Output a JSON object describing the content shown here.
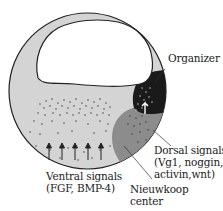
{
  "diagram": {
    "type": "embryo-signaling-diagram",
    "colors": {
      "embryo_fill": "#d4d4d4",
      "outline": "#222222",
      "blastocoel_fill": "#ffffff",
      "organizer_fill": "#1a1a1a",
      "nieuwkoop_fill": "#8c8c8c",
      "dots": "#333333"
    },
    "labels": {
      "organizer": "Organizer",
      "dorsal_title": "Dorsal signals",
      "dorsal_line2": "(Vg1, noggin,",
      "dorsal_line3": "activin,wnt)",
      "ventral_title": "Ventral signals",
      "ventral_line2": "(FGF, BMP-4)",
      "nieuwkoop_line1": "Nieuwkoop",
      "nieuwkoop_line2": "center"
    },
    "arrows": {
      "count": 5,
      "direction": "up"
    }
  }
}
